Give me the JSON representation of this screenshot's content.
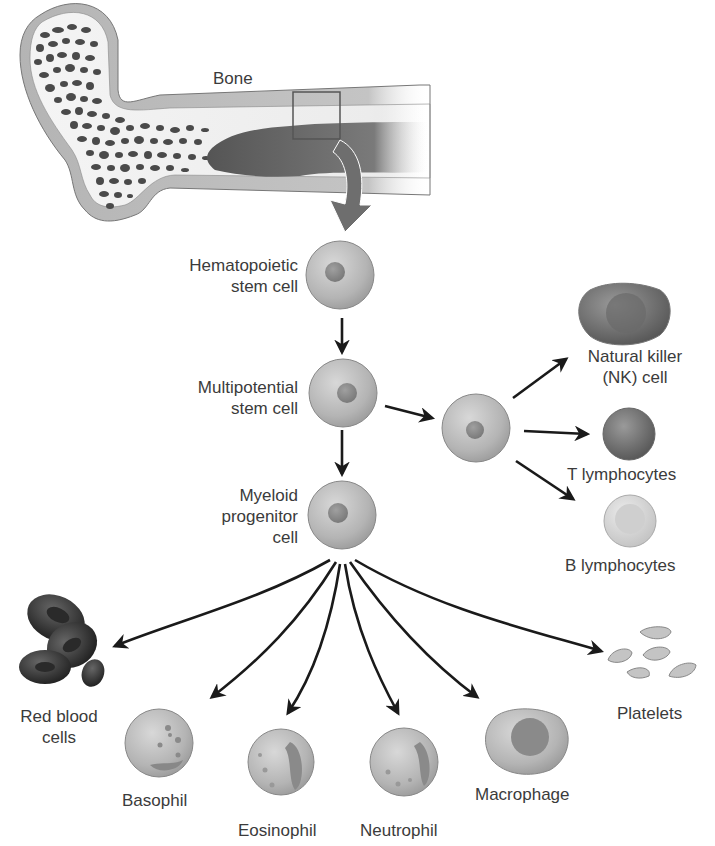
{
  "diagram": {
    "source": {
      "label": "Bone"
    },
    "stem_cells": [
      {
        "id": "hsc",
        "label_line1": "Hematopoietic",
        "label_line2": "stem cell"
      },
      {
        "id": "mpsc",
        "label_line1": "Multipotential",
        "label_line2": "stem cell"
      },
      {
        "id": "myeloid",
        "label_line1": "Myeloid",
        "label_line2": "progenitor",
        "label_line3": "cell"
      }
    ],
    "lymphoid_branch": {
      "progenitor_label": "",
      "products": [
        {
          "id": "nk",
          "label_line1": "Natural killer",
          "label_line2": "(NK) cell"
        },
        {
          "id": "t",
          "label": "T lymphocytes"
        },
        {
          "id": "b",
          "label": "B lymphocytes"
        }
      ]
    },
    "myeloid_products": [
      {
        "id": "rbc",
        "label_line1": "Red blood",
        "label_line2": "cells"
      },
      {
        "id": "basophil",
        "label": "Basophil"
      },
      {
        "id": "eosinophil",
        "label": "Eosinophil"
      },
      {
        "id": "neutrophil",
        "label": "Neutrophil"
      },
      {
        "id": "macrophage",
        "label": "Macrophage"
      },
      {
        "id": "platelets",
        "label": "Platelets"
      }
    ],
    "edges": [
      {
        "from": "bone",
        "to": "hsc"
      },
      {
        "from": "hsc",
        "to": "mpsc"
      },
      {
        "from": "mpsc",
        "to": "myeloid"
      },
      {
        "from": "mpsc",
        "to": "lymphoid_progenitor"
      },
      {
        "from": "lymphoid_progenitor",
        "to": "nk"
      },
      {
        "from": "lymphoid_progenitor",
        "to": "t"
      },
      {
        "from": "lymphoid_progenitor",
        "to": "b"
      },
      {
        "from": "myeloid",
        "to": "rbc"
      },
      {
        "from": "myeloid",
        "to": "basophil"
      },
      {
        "from": "myeloid",
        "to": "eosinophil"
      },
      {
        "from": "myeloid",
        "to": "neutrophil"
      },
      {
        "from": "myeloid",
        "to": "macrophage"
      },
      {
        "from": "myeloid",
        "to": "platelets"
      }
    ],
    "colors": {
      "cell_fill": "#b8b8b8",
      "cell_edge": "#8a8a8a",
      "nucleus": "#8c8c8c",
      "rbc": "#3a3a3a",
      "arrow": "#1a1a1a",
      "bone_arrow": "#6e6e6e",
      "text": "#3b3b3b"
    }
  }
}
